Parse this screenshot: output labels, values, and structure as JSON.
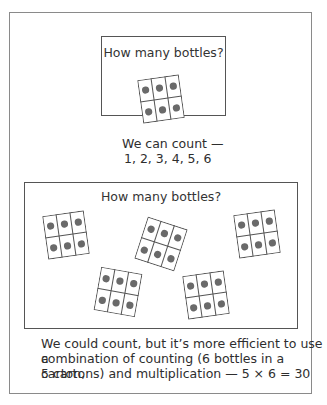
{
  "top_panel": {
    "title": "How many bottles?",
    "cartons": 1,
    "caption_line1": "We can count —",
    "caption_line2": "1, 2, 3, 4, 5, 6"
  },
  "bottom_panel": {
    "title": "How many bottles?",
    "cartons": 5,
    "caption_line1": "We could count, but it’s more efficient to use a",
    "caption_line2": "combination of counting (6 bottles in a carton,",
    "caption_line3": "5 cartons) and multiplication — 5 × 6 = 30"
  },
  "carton": {
    "rows": 2,
    "cols": 3,
    "bottles_per_carton": 6
  },
  "colors": {
    "dot": "#6a6a6a",
    "line": "#555555",
    "frame": "#8a8a8a"
  }
}
